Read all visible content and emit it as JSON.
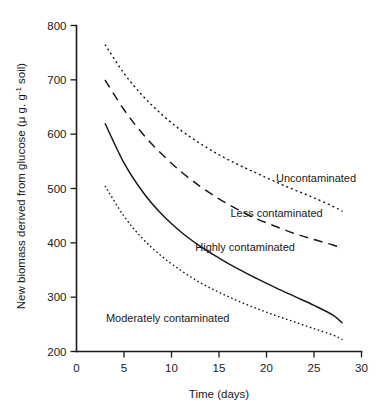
{
  "chart_data": {
    "type": "line",
    "title": "",
    "xlabel": "Time (days)",
    "ylabel": "New biomass derived from glucose (μ g. g soil)",
    "ylabel_main": "New biomass derived from glucose (μ g. g",
    "ylabel_sup": "-1",
    "ylabel_tail": " soil)",
    "xlim": [
      0,
      30
    ],
    "ylim": [
      200,
      800
    ],
    "xticks": [
      0,
      5,
      10,
      15,
      20,
      25,
      30
    ],
    "xtick_labels": [
      "0",
      "5",
      "10",
      "15",
      "20",
      "25",
      "30"
    ],
    "yticks": [
      200,
      300,
      400,
      500,
      600,
      700,
      800
    ],
    "ytick_labels": [
      "200",
      "300",
      "400",
      "500",
      "600",
      "700",
      "800"
    ],
    "grid": false,
    "legend_position": "inline-annotations",
    "x": [
      3,
      5,
      7,
      9,
      11,
      13,
      15,
      17,
      19,
      21,
      23,
      25,
      27,
      28
    ],
    "series": [
      {
        "name": "Uncontaminated",
        "style": "dotted-fine",
        "dasharray": "2,3",
        "stroke_width": 1.4,
        "values": [
          765,
          712,
          670,
          636,
          607,
          583,
          562,
          544,
          528,
          512,
          497,
          483,
          467,
          458
        ],
        "label": "Uncontaminated",
        "label_x": 21.0,
        "label_y": 520
      },
      {
        "name": "Less contaminated",
        "style": "dashed",
        "dasharray": "9,6",
        "stroke_width": 1.5,
        "values": [
          700,
          645,
          600,
          563,
          531,
          504,
          481,
          461,
          444,
          430,
          417,
          406,
          396,
          390
        ],
        "label": "Less contaminated",
        "label_x": 16.2,
        "label_y": 455
      },
      {
        "name": "Highly contaminated",
        "style": "solid",
        "dasharray": "none",
        "stroke_width": 1.5,
        "values": [
          620,
          547,
          493,
          452,
          420,
          394,
          372,
          352,
          334,
          317,
          301,
          285,
          267,
          252
        ],
        "label": "Highly contaminated",
        "label_x": 12.5,
        "label_y": 393
      },
      {
        "name": "Moderately contaminated",
        "style": "dotted-fine",
        "dasharray": "1.6,2.6",
        "stroke_width": 1.4,
        "values": [
          505,
          449,
          407,
          375,
          349,
          327,
          309,
          293,
          279,
          266,
          254,
          242,
          230,
          222
        ],
        "label": "Moderately contaminated",
        "label_x": 3.1,
        "label_y": 262
      }
    ]
  }
}
